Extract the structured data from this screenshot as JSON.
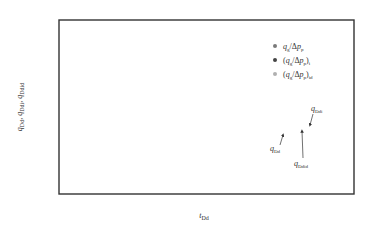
{
  "chart_data": {
    "type": "line",
    "title": "",
    "xlabel": "t_Dd",
    "ylabel": "q_Dd, q_Ddi, q_Ddid",
    "xscale": "log",
    "yscale": "log",
    "xlim": [
      0.001,
      100
    ],
    "ylim": [
      0.01,
      10
    ],
    "x_ticks": [
      "10^-3",
      "10^-2",
      "10^-1",
      "1",
      "10",
      "10^2"
    ],
    "y_ticks": [
      "10^-2",
      "10^-1",
      "1",
      "10"
    ],
    "grid": false,
    "legend": {
      "title": "生产数据",
      "position": "upper right",
      "entries": [
        {
          "label": "q_g/Δp_p",
          "color": "#7a7a7a"
        },
        {
          "label": "(q_g/Δp_p)_i",
          "color": "#444444"
        },
        {
          "label": "(q_g/Δp_p)_id",
          "color": "#b0b0b0"
        }
      ]
    },
    "annotations": [
      {
        "text": "q_Ddi",
        "x": 30,
        "y": 0.2
      },
      {
        "text": "q_Dd",
        "x": 3,
        "y": 0.06
      },
      {
        "text": "q_Ddid",
        "x": 8,
        "y": 0.04
      }
    ],
    "type_curves": {
      "upper_stems_start_q_at_t_0.001": [
        8.5,
        7.5,
        6.5,
        5.5,
        4.5,
        3.6,
        2.8,
        2.2,
        1.8,
        1.5,
        1.3,
        1.2
      ],
      "lower_stems_start_q_at_t_0.001": [
        0.55,
        0.32,
        0.2,
        0.16
      ],
      "convergence_point": {
        "t": 3,
        "q": 0.15
      },
      "tails": [
        {
          "name": "q_Ddi",
          "q_at_t_100": 0.05
        },
        {
          "name": "q_Ddid",
          "q_at_t_100": 0.04
        },
        {
          "name": "q_Dd",
          "q_at_t_100": 0.01
        }
      ]
    },
    "series": [
      {
        "name": "q_g/Δp_p",
        "marker": "circle",
        "color": "#7a7a7a",
        "x": [
          0.003,
          0.03,
          0.05,
          0.2,
          0.4,
          0.8,
          1.2,
          2.0
        ],
        "y": [
          3.5,
          2.0,
          1.9,
          1.4,
          1.1,
          0.9,
          0.7,
          0.5
        ]
      },
      {
        "name": "(q_g/Δp_p)_i",
        "marker": "circle",
        "color": "#444444",
        "x": [
          0.003,
          0.03,
          0.05,
          0.2,
          0.4,
          0.8,
          1.2,
          2.0,
          3.0
        ],
        "y": [
          5.0,
          3.4,
          3.2,
          2.2,
          1.8,
          1.5,
          1.2,
          0.9,
          0.55
        ]
      },
      {
        "name": "(q_g/Δp_p)_id",
        "marker": "circle",
        "color": "#b0b0b0",
        "x": [
          0.1,
          0.15,
          0.2,
          0.3,
          0.5,
          0.8,
          1.0,
          1.5,
          2.0,
          3.0
        ],
        "y": [
          0.55,
          0.45,
          0.4,
          0.32,
          0.28,
          0.25,
          0.22,
          0.2,
          0.19,
          0.18
        ]
      }
    ]
  }
}
